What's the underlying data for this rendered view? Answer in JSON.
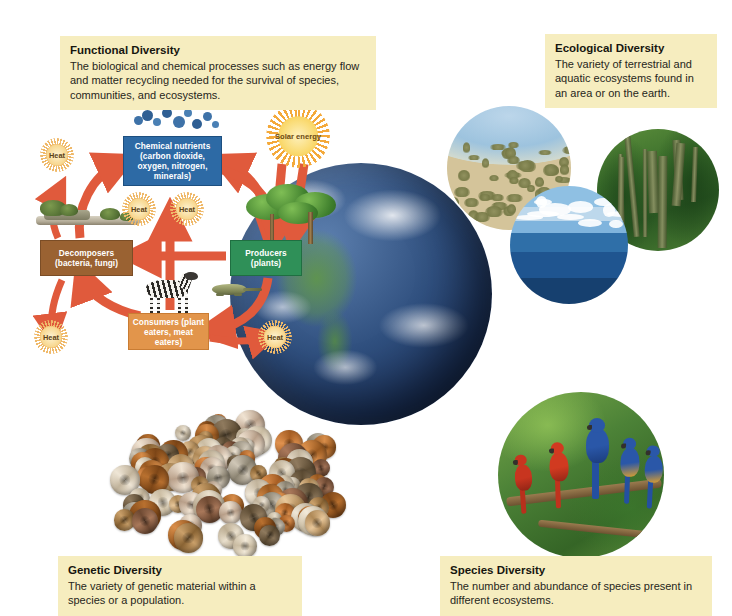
{
  "figure": {
    "center_graphic": "earth-globe"
  },
  "captions": [
    {
      "key": "functional",
      "title": "Functional Diversity",
      "body": "The biological and chemical processes such as energy flow and matter recycling needed for the survival of species, communities, and ecosystems.",
      "bg": "#f6edbf"
    },
    {
      "key": "ecological",
      "title": "Ecological Diversity",
      "body": "The variety of terrestrial and aquatic ecosystems found in an area or on the earth.",
      "bg": "#f6edbf"
    },
    {
      "key": "genetic",
      "title": "Genetic Diversity",
      "body": "The variety of genetic material within a species or a population.",
      "bg": "#f6edbf"
    },
    {
      "key": "species",
      "title": "Species Diversity",
      "body": "The number and abundance of species present in different ecosystems.",
      "bg": "#f6edbf"
    }
  ],
  "cycle": {
    "nodes": [
      {
        "key": "nutrients",
        "label": "Chemical nutrients (carbon dioxide, oxygen, nitrogen, minerals)",
        "color": "#2d6aa5"
      },
      {
        "key": "producers",
        "label": "Producers (plants)",
        "color": "#2f9058"
      },
      {
        "key": "decomposers",
        "label": "Decomposers (bacteria, fungi)",
        "color": "#9a6232"
      },
      {
        "key": "consumers",
        "label": "Consumers (plant eaters, meat eaters)",
        "color": "#e2954b"
      }
    ],
    "sun_label": "Solar energy",
    "heat_label": "Heat",
    "heat_count": 5,
    "arrow_color": "#e05a3c"
  },
  "photos": [
    {
      "key": "desert",
      "name": "desert-scrubland-photo"
    },
    {
      "key": "forest",
      "name": "temperate-forest-photo"
    },
    {
      "key": "ocean",
      "name": "ocean-photo"
    },
    {
      "key": "macaw",
      "name": "macaws-on-branch-photo"
    },
    {
      "key": "shells",
      "name": "snail-shells-photo"
    }
  ]
}
